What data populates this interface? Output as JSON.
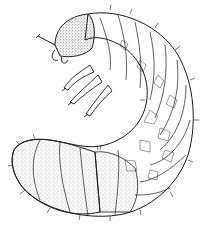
{
  "image": {
    "subject": "beetle larva (white grub) line illustration",
    "style": "black ink line art with stippling",
    "colors": {
      "background": "#ffffff",
      "ink": "#1a1a1a",
      "stipple": "#9a9a9a"
    }
  }
}
